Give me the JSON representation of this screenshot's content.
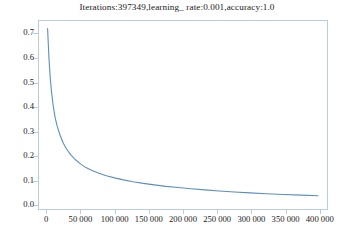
{
  "chart_data": {
    "type": "line",
    "title": "Iterations:397349,learning_ rate:0.001,accuracy:1.0",
    "xlabel": "",
    "ylabel": "",
    "xlim": [
      -12000,
      412000
    ],
    "ylim": [
      -0.02,
      0.755
    ],
    "grid": false,
    "legend": null,
    "line_color": "#5b8fc0",
    "frame_color": "#b9cde0",
    "x_tick_labels": [
      "0",
      "50 000",
      "100 000",
      "150 000",
      "200 000",
      "250 000",
      "300 000",
      "350 000",
      "400 000"
    ],
    "x_ticks": [
      0,
      50000,
      100000,
      150000,
      200000,
      250000,
      300000,
      350000,
      400000
    ],
    "y_tick_labels": [
      "0.0",
      "0.1",
      "0.2",
      "0.3",
      "0.4",
      "0.5",
      "0.6",
      "0.7"
    ],
    "y_ticks": [
      0.0,
      0.1,
      0.2,
      0.3,
      0.4,
      0.5,
      0.6,
      0.7
    ],
    "series": [
      {
        "name": "loss",
        "x": [
          2000,
          4000,
          6000,
          8000,
          10000,
          13000,
          16000,
          20000,
          25000,
          30000,
          36000,
          42000,
          50000,
          58000,
          67000,
          77000,
          88000,
          100000,
          113000,
          127000,
          142000,
          158000,
          175000,
          193000,
          212000,
          232000,
          253000,
          275000,
          298000,
          322000,
          347000,
          373000,
          397349
        ],
        "y": [
          0.72,
          0.6,
          0.515,
          0.455,
          0.41,
          0.358,
          0.322,
          0.287,
          0.252,
          0.228,
          0.205,
          0.187,
          0.168,
          0.153,
          0.141,
          0.13,
          0.12,
          0.111,
          0.103,
          0.0955,
          0.0885,
          0.0825,
          0.0765,
          0.0715,
          0.0665,
          0.062,
          0.0575,
          0.0535,
          0.05,
          0.0465,
          0.0435,
          0.0405,
          0.038
        ]
      }
    ]
  }
}
